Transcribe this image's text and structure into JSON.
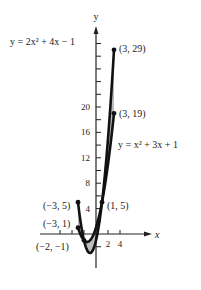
{
  "chart_data": {
    "type": "line",
    "title": "",
    "xlabel": "x",
    "ylabel": "y",
    "xlim": [
      -9,
      9
    ],
    "ylim": [
      -5,
      32
    ],
    "x_ticks": [
      {
        "value": -6,
        "label": ""
      },
      {
        "value": -4,
        "label": ""
      },
      {
        "value": -2,
        "label": ""
      },
      {
        "value": 2,
        "label": "2"
      },
      {
        "value": 4,
        "label": "4"
      }
    ],
    "y_ticks": [
      {
        "value": -2,
        "label": ""
      },
      {
        "value": 2,
        "label": ""
      },
      {
        "value": 4,
        "label": "4"
      },
      {
        "value": 6,
        "label": ""
      },
      {
        "value": 8,
        "label": "8"
      },
      {
        "value": 10,
        "label": ""
      },
      {
        "value": 12,
        "label": "12"
      },
      {
        "value": 14,
        "label": ""
      },
      {
        "value": 16,
        "label": "16"
      },
      {
        "value": 18,
        "label": ""
      },
      {
        "value": 20,
        "label": "20"
      },
      {
        "value": 22,
        "label": ""
      },
      {
        "value": 24,
        "label": ""
      },
      {
        "value": 26,
        "label": ""
      },
      {
        "value": 28,
        "label": ""
      },
      {
        "value": 30,
        "label": ""
      }
    ],
    "series": [
      {
        "name": "y = 2x² + 4x − 1",
        "label": "y = 2x² + 4x − 1",
        "domain": [
          -3,
          3
        ],
        "x": [
          -3,
          -2,
          -1,
          0,
          1,
          2,
          3
        ],
        "y": [
          5,
          -1,
          -3,
          -1,
          5,
          15,
          29
        ]
      },
      {
        "name": "y = x² + 3x + 1",
        "label": "y = x² + 3x + 1",
        "domain": [
          -3,
          3
        ],
        "x": [
          -3,
          -2,
          -1,
          0,
          1,
          2,
          3
        ],
        "y": [
          1,
          -1,
          -1,
          1,
          5,
          11,
          19
        ]
      }
    ],
    "annotations": [
      {
        "text": "(3, 29)",
        "x": 3,
        "y": 29
      },
      {
        "text": "(3, 19)",
        "x": 3,
        "y": 19
      },
      {
        "text": "(−3, 5)",
        "x": -3,
        "y": 5
      },
      {
        "text": "(−3, 1)",
        "x": -3,
        "y": 1
      },
      {
        "text": "(1, 5)",
        "x": 1,
        "y": 5
      },
      {
        "text": "(−2, −1)",
        "x": -2,
        "y": -1
      }
    ],
    "shaded_region": "area between the two curves on [-3, 3]",
    "grid": false,
    "legend": "none (curves labeled inline)"
  },
  "labels": {
    "y_axis": "y",
    "x_axis": "x",
    "curve1": "y = 2x² + 4x − 1",
    "curve2": "y = x² + 3x + 1",
    "p_3_29": "(3, 29)",
    "p_3_19": "(3, 19)",
    "p_m3_5": "(−3, 5)",
    "p_m3_1": "(−3, 1)",
    "p_1_5": "(1, 5)",
    "p_m2_m1": "(−2, −1)",
    "t20": "20",
    "t16": "16",
    "t12": "12",
    "t8": "8",
    "t4": "4",
    "tx2": "2",
    "tx4": "4"
  }
}
